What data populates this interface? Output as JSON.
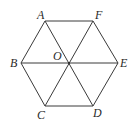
{
  "figure": {
    "type": "regular-hexagon",
    "colors": {
      "stroke": "#3a3a3a",
      "label": "#2a2a2a",
      "background": "#ffffff"
    },
    "points": {
      "A": {
        "label": "A",
        "x": 45,
        "y": 21
      },
      "B": {
        "label": "B",
        "x": 21,
        "y": 63
      },
      "C": {
        "label": "C",
        "x": 45,
        "y": 106
      },
      "D": {
        "label": "D",
        "x": 93,
        "y": 106
      },
      "E": {
        "label": "E",
        "x": 118,
        "y": 63
      },
      "F": {
        "label": "F",
        "x": 93,
        "y": 21
      },
      "O": {
        "label": "O",
        "x": 69,
        "y": 63
      }
    },
    "segments": [
      [
        "A",
        "F"
      ],
      [
        "F",
        "E"
      ],
      [
        "E",
        "D"
      ],
      [
        "D",
        "C"
      ],
      [
        "C",
        "B"
      ],
      [
        "B",
        "A"
      ],
      [
        "A",
        "D"
      ],
      [
        "F",
        "C"
      ],
      [
        "B",
        "E"
      ]
    ]
  }
}
